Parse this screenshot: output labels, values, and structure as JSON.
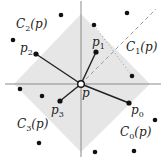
{
  "diagram": {
    "center": {
      "name": "p",
      "x": 81,
      "y": 84
    },
    "diamond": {
      "left": [
        14,
        84
      ],
      "top": [
        81,
        14
      ],
      "right": [
        150,
        84
      ],
      "bottom": [
        81,
        152
      ],
      "fill": "#e6e6e6"
    },
    "axes": {
      "horizontal": {
        "x1": 5,
        "x2": 161,
        "y": 84
      },
      "vertical": {
        "x": 81,
        "y1": 1,
        "y2": 157
      },
      "color": "#8a8a8a"
    },
    "neighbors": [
      {
        "name": "p0",
        "x": 129,
        "y": 103
      },
      {
        "name": "p1",
        "x": 96,
        "y": 52
      },
      {
        "name": "p2",
        "x": 36,
        "y": 54
      },
      {
        "name": "p3",
        "x": 60,
        "y": 101
      }
    ],
    "other_points": [
      [
        61,
        15
      ],
      [
        13,
        40
      ],
      [
        127,
        13
      ],
      [
        94,
        25
      ],
      [
        132,
        76
      ],
      [
        20,
        89
      ],
      [
        42,
        96
      ],
      [
        39,
        143
      ],
      [
        95,
        152
      ],
      [
        134,
        151
      ],
      [
        155,
        120
      ]
    ],
    "dashed_line": {
      "x1": 81,
      "y1": 84,
      "x2": 156,
      "y2": 9
    },
    "dotted_line": {
      "x1": 94,
      "y1": 25,
      "x2": 132,
      "y2": 76
    },
    "labels": {
      "c0": {
        "main": "C",
        "sub": "0",
        "rest": "(p)"
      },
      "c1": {
        "main": "C",
        "sub": "1",
        "rest": "(p)"
      },
      "c2": {
        "main": "C",
        "sub": "2",
        "rest": "(p)"
      },
      "c3": {
        "main": "C",
        "sub": "3",
        "rest": "(p)"
      },
      "p": "p",
      "p0": {
        "main": "p",
        "sub": "0"
      },
      "p1": {
        "main": "p",
        "sub": "1"
      },
      "p2": {
        "main": "p",
        "sub": "2"
      },
      "p3": {
        "main": "p",
        "sub": "3"
      }
    }
  }
}
